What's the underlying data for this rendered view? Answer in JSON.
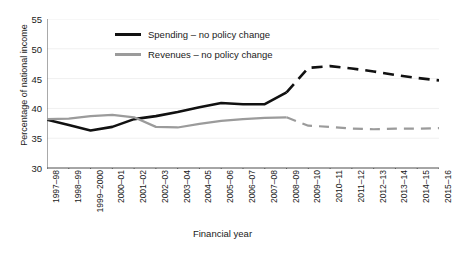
{
  "chart_data": {
    "type": "line",
    "title": "",
    "xlabel": "Financial year",
    "ylabel": "Percentage of national income",
    "grid": false,
    "legend_position": "top-left-inside",
    "ylim": [
      30,
      55
    ],
    "yticks": [
      55,
      50,
      45,
      40,
      35,
      30
    ],
    "categories": [
      "1997–98",
      "1998–99",
      "1999–2000",
      "2000–01",
      "2001–02",
      "2002–03",
      "2003–04",
      "2004–05",
      "2005–06",
      "2006–07",
      "2007–08",
      "2008–09",
      "2009–10",
      "2010–11",
      "2011–12",
      "2012–13",
      "2013–14",
      "2014–15",
      "2015–16"
    ],
    "series": [
      {
        "name": "Spending – no policy change",
        "color": "#111111",
        "values": [
          38.1,
          37.2,
          36.3,
          36.9,
          38.2,
          38.7,
          39.4,
          40.2,
          40.9,
          40.7,
          40.7,
          42.7,
          46.8,
          47.1,
          46.7,
          46.2,
          45.6,
          45.1,
          44.7
        ],
        "solid_through_index": 11,
        "style_after": "dashed"
      },
      {
        "name": "Revenues – no policy change",
        "color": "#9b9b9b",
        "values": [
          38.2,
          38.3,
          38.7,
          38.9,
          38.5,
          36.9,
          36.8,
          37.4,
          37.9,
          38.2,
          38.4,
          38.5,
          37.1,
          36.9,
          36.6,
          36.5,
          36.6,
          36.6,
          36.7
        ],
        "solid_through_index": 11,
        "style_after": "dashed"
      }
    ]
  },
  "axis": {
    "y_title": "Percentage of national income",
    "x_title": "Financial year"
  },
  "legend": {
    "items": [
      {
        "label": "Spending – no policy change",
        "swatch": "black"
      },
      {
        "label": "Revenues – no policy change",
        "swatch": "gray"
      }
    ]
  },
  "colors": {
    "spending": "#111111",
    "revenues": "#9b9b9b",
    "axis": "#555555",
    "text": "#1a1a1a",
    "background": "#ffffff"
  }
}
